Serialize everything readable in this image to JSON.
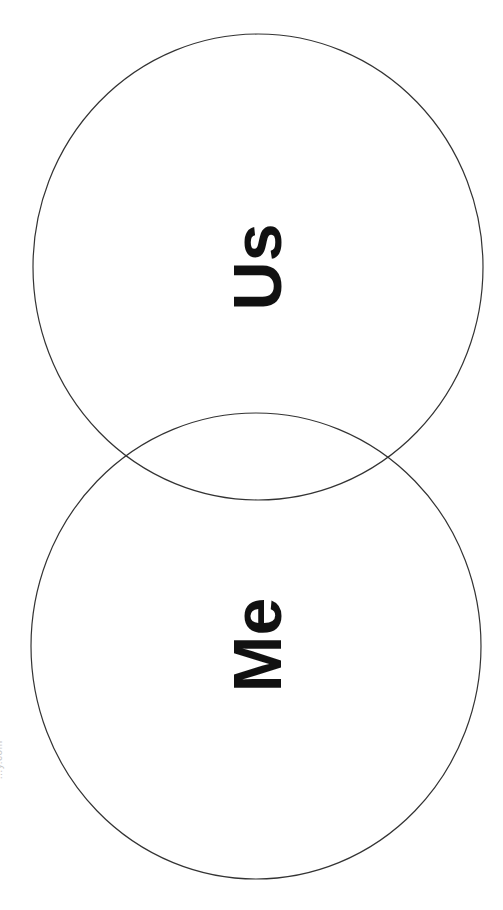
{
  "diagram": {
    "type": "venn",
    "orientation": "vertical, labels rotated -90deg",
    "circles": [
      {
        "id": "upper",
        "label": "Us",
        "cx": 258,
        "cy": 267,
        "rx": 225,
        "ry": 233
      },
      {
        "id": "lower",
        "label": "Me",
        "cx": 256,
        "cy": 646,
        "rx": 225,
        "ry": 233
      }
    ],
    "stroke_color": "#333333",
    "label_color": "#111111",
    "background": "#ffffff"
  },
  "labels": {
    "us": "Us",
    "me": "Me"
  },
  "watermark": {
    "text": "…y.com"
  }
}
